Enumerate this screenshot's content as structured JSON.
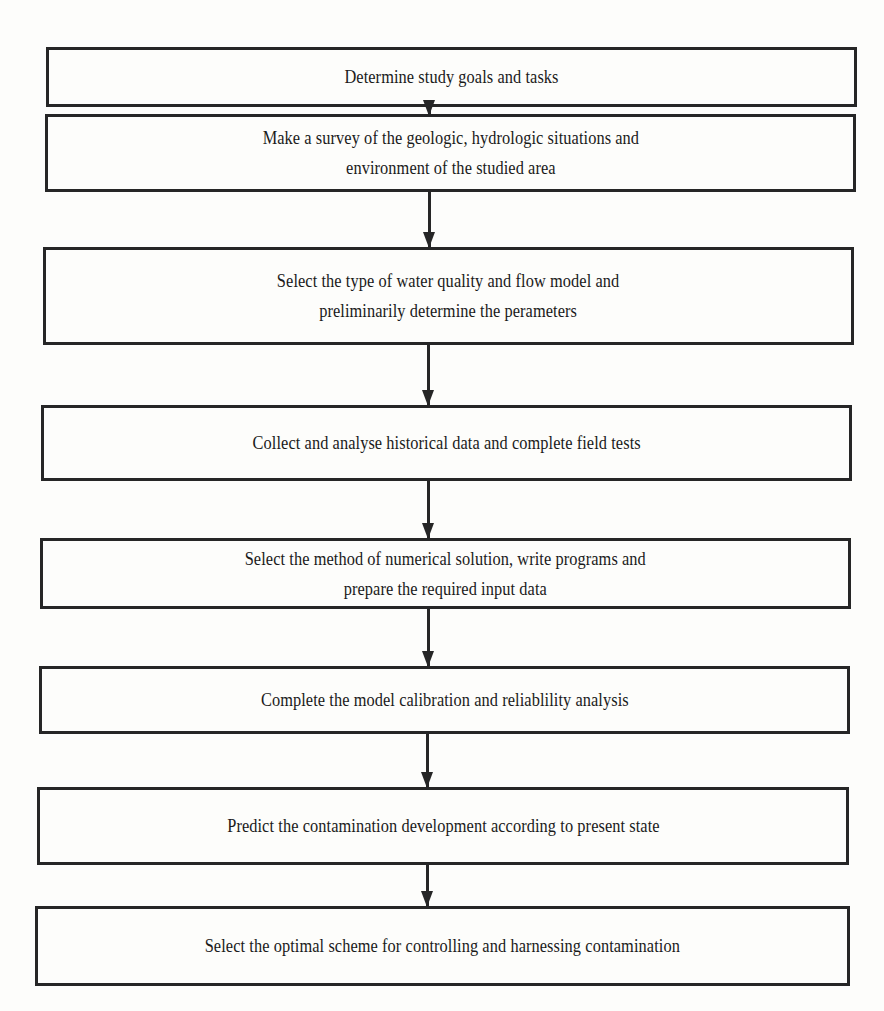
{
  "flowchart": {
    "steps": [
      {
        "label": "Determine study goals and tasks"
      },
      {
        "label": "Make a survey of the geologic, hydrologic situations and\nenvironment of the studied area"
      },
      {
        "label": "Select the type of water quality and flow model and\npreliminarily determine the perameters"
      },
      {
        "label": "Collect and analyse historical data and complete field tests"
      },
      {
        "label": "Select the method of numerical solution, write programs and\nprepare the required input data"
      },
      {
        "label": "Complete the model calibration and reliablility analysis"
      },
      {
        "label": "Predict the contamination development according to present state"
      },
      {
        "label": "Select the optimal scheme for controlling and harnessing contamination"
      }
    ],
    "connectors": [
      {
        "from": 0,
        "to": 1
      },
      {
        "from": 1,
        "to": 2
      },
      {
        "from": 2,
        "to": 3
      },
      {
        "from": 3,
        "to": 4
      },
      {
        "from": 4,
        "to": 5
      },
      {
        "from": 5,
        "to": 6
      },
      {
        "from": 6,
        "to": 7
      }
    ]
  }
}
